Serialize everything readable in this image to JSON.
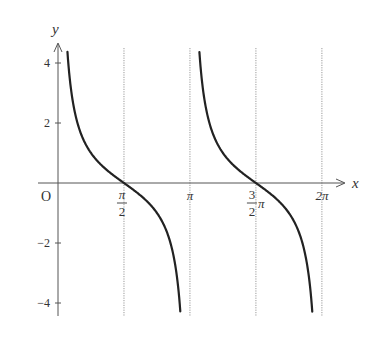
{
  "chart_data": {
    "type": "line",
    "title": "",
    "function": "y = cot x",
    "xlabel": "x",
    "ylabel": "y",
    "origin_label": "O",
    "xlim": [
      0,
      6.6
    ],
    "ylim": [
      -4.4,
      4.6
    ],
    "x_ticks": [
      {
        "value": 1.5708,
        "label_num": "π",
        "label_den": "2",
        "kind": "frac"
      },
      {
        "value": 3.1416,
        "label": "π",
        "kind": "plain"
      },
      {
        "value": 4.7124,
        "label_coef_num": "3",
        "label_coef_den": "2",
        "label_suffix": "π",
        "kind": "coef"
      },
      {
        "value": 6.2832,
        "label": "2π",
        "kind": "plain"
      }
    ],
    "y_ticks": [
      {
        "value": 4,
        "label": "4"
      },
      {
        "value": 2,
        "label": "2"
      },
      {
        "value": -2,
        "label": "−2"
      },
      {
        "value": -4,
        "label": "−4"
      }
    ],
    "asymptotes_dotted": [
      1.5708,
      3.1416,
      4.7124,
      6.2832
    ],
    "series": [
      {
        "name": "cot x branch 1",
        "x_range": [
          0.225,
          2.912
        ],
        "color": "#222222"
      },
      {
        "name": "cot x branch 2",
        "x_range": [
          3.367,
          6.054
        ],
        "color": "#222222"
      }
    ],
    "grid": false,
    "legend": null
  },
  "layout": {
    "origin_px": [
      58,
      183
    ],
    "px_per_x_unit": 42.0,
    "px_per_y_unit": 30.0
  }
}
